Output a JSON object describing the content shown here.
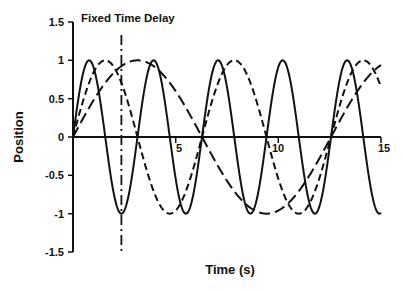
{
  "chart_data": {
    "type": "line",
    "title": "",
    "xlabel": "Time (s)",
    "ylabel": "Position",
    "xlim": [
      0,
      15
    ],
    "ylim": [
      -1.5,
      1.5
    ],
    "x_ticks": [
      5,
      10,
      15
    ],
    "x_tick_labels": [
      "5",
      "10",
      "15"
    ],
    "y_ticks": [
      -1.5,
      -1,
      -0.5,
      0,
      0.5,
      1,
      1.5
    ],
    "y_tick_labels": [
      "-1.5",
      "-1",
      "-0.5",
      "0",
      "0.5",
      "1",
      "1.5"
    ],
    "grid": false,
    "legend": "none",
    "annotations": [
      {
        "text": "Fixed Time Delay",
        "x": 2.36,
        "style": "dash-dot vertical line",
        "y_range": [
          -1.45,
          1.3
        ]
      }
    ],
    "series": [
      {
        "name": "sin(2t)",
        "style": "solid",
        "angular_frequency": 2,
        "amplitude": 1,
        "peaks_t": [
          0.79,
          3.93,
          7.07,
          10.21,
          13.35
        ],
        "troughs_t": [
          2.36,
          5.5,
          8.64,
          11.78,
          14.92
        ]
      },
      {
        "name": "sin(t)",
        "style": "short-dash",
        "angular_frequency": 1,
        "amplitude": 1,
        "peaks_t": [
          1.57,
          7.85,
          14.14
        ],
        "troughs_t": [
          4.71,
          10.99
        ]
      },
      {
        "name": "sin(t/2)",
        "style": "long-dash",
        "angular_frequency": 0.5,
        "amplitude": 1,
        "peaks_t": [
          3.14
        ],
        "troughs_t": [
          9.42
        ],
        "end_value": 0.94
      }
    ],
    "x": [
      0,
      0.5,
      1,
      1.5,
      2,
      2.5,
      3,
      3.5,
      4,
      4.5,
      5,
      5.5,
      6,
      6.5,
      7,
      7.5,
      8,
      8.5,
      9,
      9.5,
      10,
      10.5,
      11,
      11.5,
      12,
      12.5,
      13,
      13.5,
      14,
      14.5,
      15
    ],
    "values_sample": {
      "sin(2t)": [
        0,
        0.84,
        0.91,
        0.14,
        -0.76,
        -0.96,
        -0.28,
        0.66,
        0.99,
        0.41,
        -0.54,
        -1.0,
        -0.54,
        0.42,
        0.99,
        0.65,
        -0.29,
        -0.96,
        -0.75,
        0.15,
        0.91,
        0.84,
        0.0,
        -0.84,
        -0.91,
        -0.13,
        0.76,
        0.96,
        0.27,
        -0.66,
        -0.99
      ],
      "sin(t)": [
        0,
        0.48,
        0.84,
        1.0,
        0.91,
        0.6,
        0.14,
        -0.35,
        -0.76,
        -0.98,
        -0.96,
        -0.71,
        -0.28,
        0.22,
        0.66,
        0.94,
        0.99,
        0.8,
        0.41,
        -0.08,
        -0.54,
        -0.88,
        -1.0,
        -0.88,
        -0.54,
        -0.07,
        0.42,
        0.8,
        0.99,
        0.93,
        0.65
      ],
      "sin(t/2)": [
        0,
        0.25,
        0.48,
        0.68,
        0.84,
        0.95,
        1.0,
        0.98,
        0.91,
        0.78,
        0.6,
        0.38,
        0.14,
        -0.11,
        -0.35,
        -0.57,
        -0.76,
        -0.89,
        -0.98,
        -1.0,
        -0.96,
        -0.86,
        -0.71,
        -0.51,
        -0.28,
        -0.03,
        0.22,
        0.45,
        0.66,
        0.82,
        0.94
      ]
    }
  },
  "labels": {
    "annotation": "Fixed Time Delay",
    "xlabel": "Time (s)",
    "ylabel": "Position",
    "x_ticks": [
      "5",
      "10",
      "15"
    ],
    "y_ticks": [
      "1.5",
      "1",
      "0.5",
      "0",
      "-0.5",
      "-1",
      "-1.5"
    ]
  },
  "colors": {
    "line": "#111111",
    "background": "#ffffff"
  }
}
